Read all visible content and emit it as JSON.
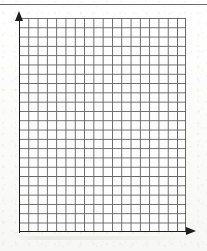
{
  "page": {
    "width": 207,
    "height": 251,
    "background_color": "#fdfdfc",
    "top_rule_color": "#6d6d6d"
  },
  "chart_data": {
    "type": "scatter",
    "title": "",
    "subtitle": "",
    "xlabel": "",
    "ylabel": "",
    "series": [
      {
        "name": "",
        "x": [],
        "y": []
      }
    ],
    "categories": [],
    "values": [],
    "annotations": [],
    "legend": {
      "entries": [],
      "position": "none"
    },
    "grid": {
      "visible": true,
      "columns": 18,
      "rows": 23,
      "cell_size_px": 9.3,
      "line_color": "#5a5a5a",
      "fill_color": "#fefefe"
    },
    "axes": {
      "x": {
        "visible": true,
        "arrow": true,
        "arrow_direction": "right",
        "color": "#1e1e1e",
        "tick_labels": [],
        "range_labeled": false
      },
      "y": {
        "visible": true,
        "arrow": true,
        "arrow_direction": "up",
        "color": "#1e1e1e",
        "tick_labels": [],
        "range_labeled": false
      }
    }
  },
  "icons": {
    "y_axis_arrow": "arrow-up-icon",
    "x_axis_arrow": "arrow-right-icon"
  }
}
